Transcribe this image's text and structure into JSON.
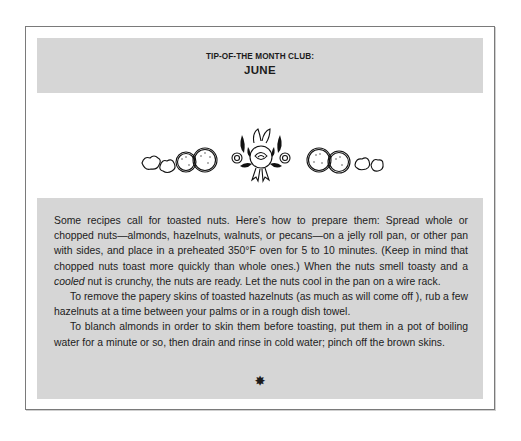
{
  "header": {
    "kicker": "TIP-OF-THE MONTH CLUB:",
    "title": "JUNE"
  },
  "ornament": {
    "icon": "floral-nut-ornament-icon",
    "description": "Decorative row of nuts, cookies and a central rose bouquet"
  },
  "body": {
    "paragraphs": [
      {
        "before_italic": "Some recipes call for toasted nuts. Here’s how to prepare them: Spread whole or chopped nuts—almonds, hazelnuts, walnuts, or pecans—on a jelly roll pan, or other pan with sides, and place in a preheated 350°F oven for 5 to 10 minutes. (Keep in mind that chopped nuts toast more quickly than whole ones.) When the nuts smell toasty and a ",
        "italic": "cooled",
        "after_italic": " nut is crunchy, the nuts are ready. Let the nuts cool in the pan on a wire rack."
      },
      {
        "text": "To remove the papery skins of toasted hazelnuts (as much as will come off ), rub a few hazelnuts at a time between your palms or in a rough dish towel."
      },
      {
        "text": "To blanch almonds in order to skin them before toasting, put them in a pot of boiling water for a minute or so, then drain and rinse in cold water; pinch off the brown skins."
      }
    ],
    "end_mark": "✸"
  },
  "colors": {
    "panel_gray": "#d6d6d6",
    "frame_border": "#7a7a7a",
    "text": "#1c1c1c"
  }
}
